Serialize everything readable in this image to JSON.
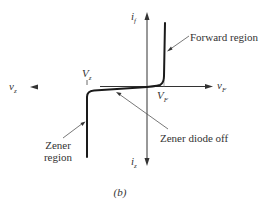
{
  "figure": {
    "caption": "(b)",
    "colors": {
      "curve": "#1a1a1a",
      "axis": "#333333",
      "leader": "#555555",
      "text": "#333333",
      "background": "#ffffff"
    }
  },
  "axes": {
    "positive_current": {
      "symbol": "i",
      "subscript": "f"
    },
    "negative_current": {
      "symbol": "i",
      "subscript": "z"
    },
    "positive_voltage": {
      "symbol": "v",
      "subscript": "F"
    },
    "negative_voltage": {
      "symbol": "v",
      "subscript": "z"
    }
  },
  "markers": {
    "zener_voltage": {
      "symbol": "V",
      "subscript": "z"
    },
    "forward_voltage": {
      "symbol": "V",
      "subscript": "F"
    }
  },
  "annotations": {
    "forward_region": "Forward region",
    "zener_off": "Zener diode off",
    "zener_region_line1": "Zener",
    "zener_region_line2": "region"
  }
}
